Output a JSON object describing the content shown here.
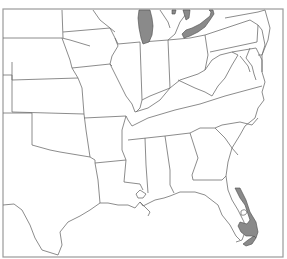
{
  "map": {
    "type": "range-map",
    "region": "Eastern and Central United States",
    "colors": {
      "background": "#ffffff",
      "state_border": "#6f6f6f",
      "frame": "#9a9a9a",
      "highlighted_range": "#8a8a8a"
    },
    "highlighted_areas": [
      {
        "name": "Eastern Wisconsin / Lake Michigan shore"
      },
      {
        "name": "Lake Erie shore (Ohio / Michigan)"
      },
      {
        "name": "South Florida (east coast and southern tip)"
      }
    ],
    "labels": []
  }
}
